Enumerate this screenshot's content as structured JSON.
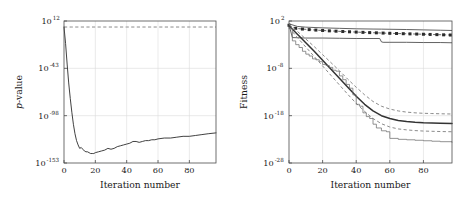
{
  "figure": {
    "background_color": "#ffffff",
    "panel_count": 2
  },
  "chart_data": [
    {
      "type": "line",
      "panel": "left",
      "title": "",
      "xlabel": "Iteration number",
      "ylabel": "p-value",
      "ylabel_style": "italic-p",
      "xlim": [
        0,
        97
      ],
      "ylim_exponent": [
        -153,
        12
      ],
      "yscale": "log",
      "xticks": [
        0,
        20,
        40,
        60,
        80
      ],
      "xtick_labels": [
        "0",
        "20",
        "40",
        "60",
        "80"
      ],
      "ytick_exponents": [
        12,
        -43,
        -98,
        -153
      ],
      "ytick_labels": [
        "10^{12}",
        "10^{-43}",
        "10^{-98}",
        "10^{-153}"
      ],
      "ytick_mantissa": [
        "10",
        "10",
        "10",
        "10"
      ],
      "ytick_exp_text": [
        "12",
        "-43",
        "-98",
        "-153"
      ],
      "grid": true,
      "legend": "none",
      "series": [
        {
          "name": "significance-threshold",
          "style": "dashed",
          "color": "#8c8c8c",
          "description": "horizontal dashed reference line",
          "x": [
            0,
            5,
            10,
            20,
            30,
            40,
            50,
            60,
            70,
            80,
            90,
            97
          ],
          "y_exponent": [
            5,
            5,
            5,
            5,
            5,
            5,
            5,
            5,
            5,
            5,
            5,
            5
          ]
        },
        {
          "name": "p-value-curve",
          "style": "solid",
          "color": "#2b2b2b",
          "description": "p-value drops steeply then slowly recovers",
          "x": [
            0,
            1,
            2,
            3,
            4,
            5,
            6,
            7,
            8,
            9,
            10,
            11,
            12,
            13,
            14,
            15,
            16,
            17,
            18,
            19,
            20,
            22,
            24,
            26,
            28,
            30,
            32,
            34,
            36,
            38,
            40,
            42,
            44,
            46,
            48,
            50,
            52,
            54,
            56,
            58,
            60,
            64,
            68,
            72,
            76,
            80,
            84,
            88,
            92,
            97
          ],
          "y_exponent": [
            5,
            -14,
            -38,
            -60,
            -78,
            -94,
            -108,
            -119,
            -127,
            -132,
            -136,
            -135,
            -137,
            -139,
            -140,
            -140,
            -141,
            -142,
            -142,
            -142,
            -141,
            -140,
            -139,
            -138,
            -136,
            -137,
            -136,
            -134,
            -133,
            -132,
            -131,
            -130,
            -128,
            -128,
            -129,
            -128,
            -127,
            -127,
            -126,
            -126,
            -125,
            -124,
            -124,
            -123,
            -122,
            -122,
            -121,
            -120,
            -119,
            -118
          ]
        }
      ]
    },
    {
      "type": "line",
      "panel": "right",
      "title": "",
      "xlabel": "Iteration number",
      "ylabel": "Fitness",
      "xlim": [
        0,
        97
      ],
      "ylim_exponent": [
        -28,
        2
      ],
      "yscale": "log",
      "xticks": [
        0,
        20,
        40,
        60,
        80
      ],
      "xtick_labels": [
        "0",
        "20",
        "40",
        "60",
        "80"
      ],
      "ytick_exponents": [
        2,
        -8,
        -18,
        -28
      ],
      "ytick_labels": [
        "10^{2}",
        "10^{-8}",
        "10^{-18}",
        "10^{-28}"
      ],
      "ytick_mantissa": [
        "10",
        "10",
        "10",
        "10"
      ],
      "ytick_exp_text": [
        "2",
        "-8",
        "-18",
        "-28"
      ],
      "grid": true,
      "legend": "none",
      "series": [
        {
          "name": "plateau-upper",
          "style": "solid",
          "color": "#3a3a3a",
          "description": "near-flat top curve slowly decreasing",
          "x": [
            0,
            5,
            10,
            20,
            30,
            40,
            50,
            55,
            60,
            70,
            80,
            90,
            97
          ],
          "y_exponent": [
            1.4,
            0.85,
            0.7,
            0.55,
            0.45,
            0.35,
            0.3,
            0.28,
            0.25,
            0.2,
            0.12,
            0.05,
            0.0
          ]
        },
        {
          "name": "plateau-markers",
          "style": "dashed-with-square-markers",
          "color": "#2b2b2b",
          "description": "dashed series with filled square markers along the plateau",
          "x": [
            0,
            4,
            8,
            12,
            16,
            20,
            24,
            28,
            32,
            36,
            40,
            44,
            48,
            52,
            56,
            60,
            64,
            68,
            72,
            76,
            80,
            84,
            88,
            92,
            96
          ],
          "y_exponent": [
            1.1,
            0.45,
            0.3,
            0.18,
            0.08,
            0.0,
            -0.08,
            -0.15,
            -0.22,
            -0.28,
            -0.34,
            -0.4,
            -0.45,
            -0.5,
            -0.55,
            -0.6,
            -0.64,
            -0.68,
            -0.72,
            -0.76,
            -0.8,
            -0.84,
            -0.88,
            -0.92,
            -0.96
          ]
        },
        {
          "name": "plateau-step",
          "style": "solid",
          "color": "#4a4a4a",
          "description": "flat curve with a step drop near iteration 55",
          "x": [
            0,
            2,
            10,
            20,
            30,
            40,
            50,
            54,
            55,
            56,
            60,
            70,
            80,
            90,
            97
          ],
          "y_exponent": [
            1.2,
            -1.5,
            -1.6,
            -1.6,
            -1.65,
            -1.7,
            -1.7,
            -1.7,
            -2.4,
            -2.5,
            -2.5,
            -2.5,
            -2.55,
            -2.55,
            -2.6
          ]
        },
        {
          "name": "mean-convergence",
          "style": "solid-thick",
          "color": "#333333",
          "description": "main descending sigmoid convergence curve",
          "x": [
            0,
            5,
            10,
            15,
            20,
            25,
            30,
            35,
            40,
            45,
            50,
            55,
            60,
            65,
            70,
            75,
            80,
            85,
            90,
            97
          ],
          "y_exponent": [
            1.0,
            -0.8,
            -2.6,
            -4.4,
            -6.3,
            -8.2,
            -10.1,
            -12.0,
            -13.9,
            -15.6,
            -17.0,
            -18.0,
            -18.6,
            -19.0,
            -19.25,
            -19.4,
            -19.5,
            -19.55,
            -19.6,
            -19.65
          ]
        },
        {
          "name": "confidence-upper",
          "style": "dashed",
          "color": "#8c8c8c",
          "description": "upper dashed confidence bound",
          "x": [
            0,
            5,
            10,
            15,
            20,
            25,
            30,
            35,
            40,
            45,
            50,
            55,
            60,
            65,
            70,
            75,
            80,
            85,
            90,
            97
          ],
          "y_exponent": [
            1.3,
            -0.2,
            -1.8,
            -3.4,
            -5.1,
            -6.8,
            -8.5,
            -10.3,
            -12.0,
            -13.6,
            -15.0,
            -16.0,
            -16.6,
            -17.0,
            -17.25,
            -17.4,
            -17.5,
            -17.55,
            -17.6,
            -17.65
          ]
        },
        {
          "name": "confidence-lower",
          "style": "dashed",
          "color": "#8c8c8c",
          "description": "lower dashed confidence bound",
          "x": [
            0,
            5,
            10,
            15,
            20,
            25,
            30,
            35,
            40,
            45,
            50,
            55,
            60,
            65,
            70,
            75,
            80,
            85,
            90,
            97
          ],
          "y_exponent": [
            0.6,
            -1.5,
            -3.5,
            -5.5,
            -7.5,
            -9.5,
            -11.5,
            -13.5,
            -15.4,
            -17.1,
            -18.6,
            -19.7,
            -20.4,
            -20.8,
            -21.0,
            -21.15,
            -21.25,
            -21.3,
            -21.35,
            -21.4
          ]
        },
        {
          "name": "best-run-staircase",
          "style": "thin-staircase",
          "color": "#6e6e6e",
          "description": "fast descending staircase curve reaching the lowest fitness",
          "x": [
            0,
            2,
            4,
            6,
            8,
            10,
            12,
            14,
            16,
            18,
            20,
            22,
            24,
            26,
            28,
            30,
            32,
            34,
            36,
            38,
            40,
            42,
            44,
            46,
            48,
            50,
            52,
            55,
            58,
            60,
            65,
            70,
            75,
            80,
            85,
            90,
            97
          ],
          "y_exponent": [
            0.5,
            -2.2,
            -3.0,
            -3.6,
            -4.4,
            -5.0,
            -5.4,
            -6.0,
            -6.2,
            -6.6,
            -7.2,
            -7.4,
            -7.8,
            -8.4,
            -8.6,
            -9.6,
            -10.4,
            -11.4,
            -12.2,
            -13.6,
            -15.6,
            -16.0,
            -17.4,
            -18.2,
            -18.6,
            -19.8,
            -20.6,
            -21.2,
            -21.4,
            -22.8,
            -23.0,
            -23.1,
            -23.2,
            -23.3,
            -23.4,
            -23.5,
            -23.6
          ]
        }
      ]
    }
  ]
}
